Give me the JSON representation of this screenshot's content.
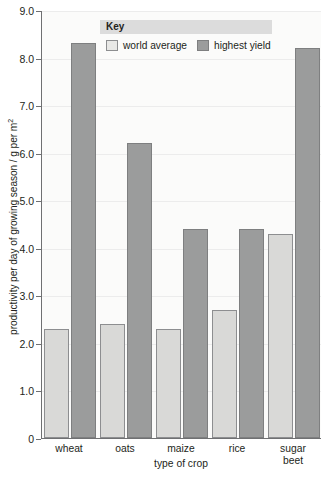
{
  "chart_data": {
    "type": "bar",
    "title": "",
    "subtitle": "",
    "xlabel": "type of crop",
    "ylabel": "productivity per day of growing season / g per m",
    "ylabel_superscript": "2",
    "categories": [
      "wheat",
      "oats",
      "maize",
      "rice",
      "sugar beet"
    ],
    "category_lines": [
      [
        "wheat"
      ],
      [
        "oats"
      ],
      [
        "maize"
      ],
      [
        "rice"
      ],
      [
        "sugar",
        "beet"
      ]
    ],
    "series": [
      {
        "name": "world average",
        "values": [
          2.3,
          2.4,
          2.3,
          2.7,
          4.3
        ],
        "color": "#d9d9d7"
      },
      {
        "name": "highest yield",
        "values": [
          8.3,
          6.2,
          4.4,
          4.4,
          8.2
        ],
        "color": "#9b9c9c"
      }
    ],
    "ylim": [
      0,
      9.0
    ],
    "yticks": [
      0,
      1.0,
      2.0,
      3.0,
      4.0,
      5.0,
      6.0,
      7.0,
      8.0,
      9.0
    ],
    "ytick_labels": [
      "0",
      "1.0",
      "2.0",
      "3.0",
      "4.0",
      "5.0",
      "6.0",
      "7.0",
      "8.0",
      "9.0"
    ],
    "grid": true,
    "legend_position": "top-center"
  },
  "legend": {
    "header": "Key",
    "items": [
      {
        "label": "world average",
        "swatch": "light"
      },
      {
        "label": "highest yield",
        "swatch": "dark"
      }
    ]
  },
  "colors": {
    "plot_background": "#fbfbfa",
    "axis": "#6f7072",
    "gridline": "#ececec",
    "legend_header_background": "#dcdcdc",
    "series_light": "#d9d9d7",
    "series_dark": "#9b9c9c",
    "text": "#231f20"
  }
}
